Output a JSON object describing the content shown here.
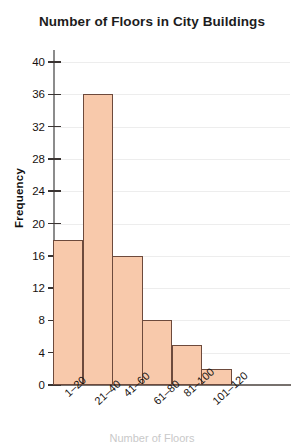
{
  "chart_data": {
    "type": "bar",
    "title": "Number of Floors in City Buildings",
    "xlabel": "Number of Floors",
    "ylabel": "Frequency",
    "categories": [
      "1–20",
      "21–40",
      "41–60",
      "61–80",
      "81–100",
      "101–120"
    ],
    "values": [
      18,
      36,
      16,
      8,
      5,
      2
    ],
    "ylim": [
      0,
      40
    ],
    "ytick_labels": [
      "0",
      "4",
      "8",
      "12",
      "16",
      "20",
      "24",
      "28",
      "32",
      "36",
      "40"
    ],
    "ytick_values": [
      0,
      4,
      8,
      12,
      16,
      20,
      24,
      28,
      32,
      36,
      40
    ],
    "grid": true,
    "legend": "none",
    "bar_fill_color": "#f8c9ab",
    "bar_border_color": "#6d4a3c",
    "gridline_color": "#ededed",
    "axis_color": "#77716e",
    "text_color": "#17120f"
  }
}
